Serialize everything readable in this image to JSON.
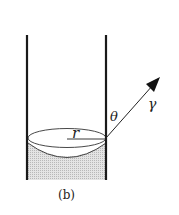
{
  "figure": {
    "caption": "(b)",
    "labels": {
      "radius": "r",
      "angle": "θ",
      "tension": "γ"
    },
    "colors": {
      "stroke": "#1a1a1a",
      "liquid": "#cfcfcf"
    }
  }
}
